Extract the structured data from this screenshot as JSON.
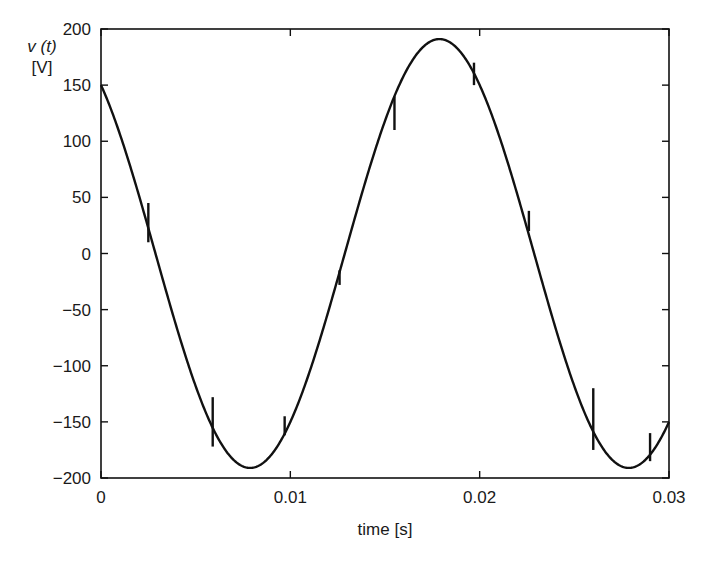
{
  "chart_data": {
    "type": "line",
    "title": "",
    "xlabel": "time [s]",
    "ylabel_line1": "v (t)",
    "ylabel_line2": "[V]",
    "xlim": [
      0,
      0.03
    ],
    "ylim": [
      -200,
      200
    ],
    "grid": false,
    "legend": null,
    "x_ticks": [
      {
        "value": 0,
        "label": "0"
      },
      {
        "value": 0.01,
        "label": "0.01"
      },
      {
        "value": 0.02,
        "label": "0.02"
      },
      {
        "value": 0.03,
        "label": "0.03"
      }
    ],
    "y_ticks": [
      {
        "value": 200,
        "label": "200"
      },
      {
        "value": 150,
        "label": "150"
      },
      {
        "value": 100,
        "label": "100"
      },
      {
        "value": 50,
        "label": "50"
      },
      {
        "value": 0,
        "label": "0"
      },
      {
        "value": -50,
        "label": "−50"
      },
      {
        "value": -100,
        "label": "−100"
      },
      {
        "value": -150,
        "label": "−150"
      },
      {
        "value": -200,
        "label": "−200"
      }
    ],
    "series": [
      {
        "name": "v(t)",
        "model": {
          "amplitude": 191,
          "frequency_hz": 50,
          "phase_rad": 0.667,
          "form": "A*cos(2*pi*f*t + phase)"
        },
        "x": [
          0,
          0.0025,
          0.005,
          0.0079,
          0.01,
          0.0125,
          0.015,
          0.0179,
          0.02,
          0.0225,
          0.025,
          0.0279,
          0.03
        ],
        "values": [
          150,
          33,
          -95,
          -191,
          -150,
          -33,
          95,
          191,
          150,
          33,
          -95,
          -191,
          -150
        ]
      }
    ],
    "spikes": [
      {
        "t": 0.0025,
        "from": 10,
        "to": 45
      },
      {
        "t": 0.0059,
        "from": -172,
        "to": -128
      },
      {
        "t": 0.0097,
        "from": -162,
        "to": -145
      },
      {
        "t": 0.0126,
        "from": -28,
        "to": -15
      },
      {
        "t": 0.0155,
        "from": 110,
        "to": 140
      },
      {
        "t": 0.0197,
        "from": 150,
        "to": 170
      },
      {
        "t": 0.0226,
        "from": 20,
        "to": 38
      },
      {
        "t": 0.026,
        "from": -175,
        "to": -120
      },
      {
        "t": 0.029,
        "from": -185,
        "to": -160
      }
    ]
  }
}
